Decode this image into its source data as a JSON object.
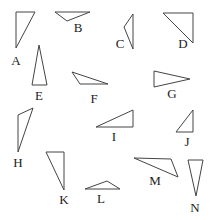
{
  "diagram": {
    "stroke_color": "#444444",
    "background": "#ffffff",
    "shapes": [
      {
        "label": "A",
        "points": "16,12 35,12 16,48",
        "label_pos": [
          16,
          65
        ]
      },
      {
        "label": "B",
        "points": "55,12 90,12 67,21",
        "curved": true,
        "label_pos": [
          78,
          32
        ]
      },
      {
        "label": "C",
        "points": "133,14 133,49 124,27",
        "curved": true,
        "label_pos": [
          120,
          48
        ]
      },
      {
        "label": "D",
        "points": "163,13 193,13 193,43",
        "label_pos": [
          183,
          48
        ]
      },
      {
        "label": "E",
        "points": "39,45 32,85 47,85",
        "label_pos": [
          39,
          100
        ]
      },
      {
        "label": "F",
        "points": "72,72 108,84 80,84",
        "label_pos": [
          94,
          103
        ]
      },
      {
        "label": "G",
        "points": "154,71 154,87 190,79",
        "label_pos": [
          172,
          98
        ]
      },
      {
        "label": "H",
        "points": "18,115 33,108 18,152",
        "label_pos": [
          18,
          167
        ]
      },
      {
        "label": "I",
        "points": "96,127 133,110 133,127",
        "label_pos": [
          114,
          141
        ]
      },
      {
        "label": "J",
        "points": "193,110 193,132 176,132",
        "label_pos": [
          187,
          146
        ]
      },
      {
        "label": "K",
        "points": "46,152 64,152 64,190",
        "label_pos": [
          64,
          204
        ]
      },
      {
        "label": "L",
        "points": "85,189 107,181 120,189",
        "label_pos": [
          101,
          203
        ]
      },
      {
        "label": "M",
        "points": "134,158 171,159 178,177",
        "label_pos": [
          155,
          185
        ]
      },
      {
        "label": "N",
        "points": "188,160 203,160 196,196",
        "label_pos": [
          195,
          212
        ]
      }
    ]
  }
}
